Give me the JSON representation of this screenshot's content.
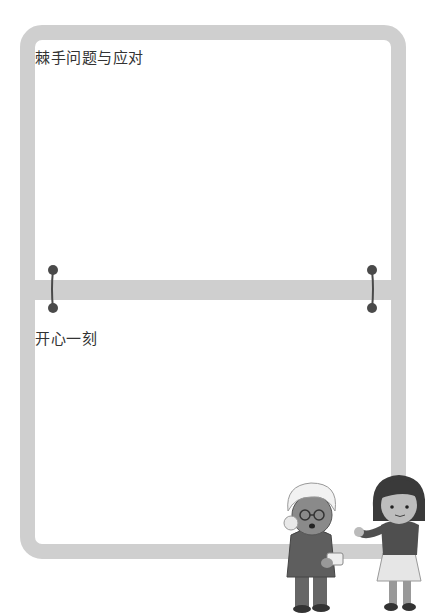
{
  "sections": [
    {
      "title": "棘手问题与应对"
    },
    {
      "title": "开心一刻"
    }
  ],
  "colors": {
    "frame": "#cfcfcf",
    "ring": "#4a4a4a",
    "text": "#333333"
  },
  "illustration": {
    "description": "grandmother with glasses and white hair holding a cup, girl with bob haircut gesturing"
  }
}
